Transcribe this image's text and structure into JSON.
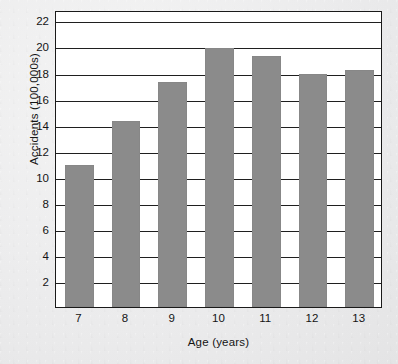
{
  "chart_data": {
    "type": "bar",
    "title": "",
    "subtitle": "",
    "xlabel": "Age  (years)",
    "ylabel": "Accidents  (100,000s)",
    "categories": [
      "7",
      "8",
      "9",
      "10",
      "11",
      "12",
      "13"
    ],
    "values": [
      10.9,
      14.3,
      17.3,
      19.9,
      19.3,
      17.9,
      18.2
    ],
    "series": [
      {
        "name": "Accidents",
        "values": [
          10.9,
          14.3,
          17.3,
          19.9,
          19.3,
          17.9,
          18.2
        ]
      }
    ],
    "ylim": [
      0,
      22.8
    ],
    "ytick_values": [
      2,
      4,
      6,
      8,
      10,
      12,
      14,
      16,
      18,
      20,
      22
    ],
    "ytick_labels": [
      "2",
      "4",
      "6",
      "8",
      "10",
      "12",
      "14",
      "16",
      "18",
      "20",
      "22"
    ],
    "xtick_labels": [
      "7",
      "8",
      "9",
      "10",
      "11",
      "12",
      "13"
    ],
    "grid": "horizontal",
    "legend": "none",
    "bar_color": "#8b8b8b",
    "axis_color": "#1a1a1a",
    "plot_background": "#ffffff",
    "page_background": "#ececed",
    "annotations": []
  }
}
